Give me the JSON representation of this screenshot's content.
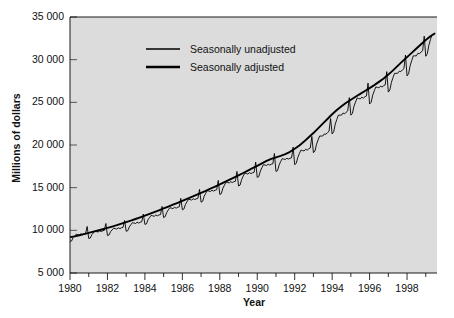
{
  "chart_data": {
    "type": "line",
    "title": "",
    "xlabel": "Year",
    "ylabel": "Millions of dollars",
    "xlim": [
      1980.0,
      1999.6
    ],
    "ylim": [
      5000,
      35000
    ],
    "grid": false,
    "legend_position": "top-left-inside",
    "y_ticks": [
      5000,
      10000,
      15000,
      20000,
      25000,
      30000,
      35000
    ],
    "y_tick_labels": [
      "5 000",
      "10 000",
      "15 000",
      "20 000",
      "25 000",
      "30 000",
      "35 000"
    ],
    "x_ticks_major": [
      1980,
      1982,
      1984,
      1986,
      1988,
      1990,
      1992,
      1994,
      1996,
      1998
    ],
    "x_tick_labels": [
      "1980",
      "1982",
      "1984",
      "1986",
      "1988",
      "1990",
      "1992",
      "1994",
      "1996",
      "1998"
    ],
    "x_ticks_minor": [
      1981,
      1983,
      1985,
      1987,
      1989,
      1991,
      1993,
      1995,
      1997,
      1999
    ],
    "plot_bg_color": "#dcdcdc",
    "line_color": "#000000",
    "series": [
      {
        "name": "Seasonally unadjusted",
        "line_width": 0.9,
        "x": [
          1980.0,
          1980.083,
          1980.167,
          1980.25,
          1980.333,
          1980.417,
          1980.5,
          1980.583,
          1980.667,
          1980.75,
          1980.833,
          1980.917,
          1981.0,
          1981.083,
          1981.167,
          1981.25,
          1981.333,
          1981.417,
          1981.5,
          1981.583,
          1981.667,
          1981.75,
          1981.833,
          1981.917,
          1982.0,
          1982.083,
          1982.167,
          1982.25,
          1982.333,
          1982.417,
          1982.5,
          1982.583,
          1982.667,
          1982.75,
          1982.833,
          1982.917,
          1983.0,
          1983.083,
          1983.167,
          1983.25,
          1983.333,
          1983.417,
          1983.5,
          1983.583,
          1983.667,
          1983.75,
          1983.833,
          1983.917,
          1984.0,
          1984.083,
          1984.167,
          1984.25,
          1984.333,
          1984.417,
          1984.5,
          1984.583,
          1984.667,
          1984.75,
          1984.833,
          1984.917,
          1985.0,
          1985.083,
          1985.167,
          1985.25,
          1985.333,
          1985.417,
          1985.5,
          1985.583,
          1985.667,
          1985.75,
          1985.833,
          1985.917,
          1986.0,
          1986.083,
          1986.167,
          1986.25,
          1986.333,
          1986.417,
          1986.5,
          1986.583,
          1986.667,
          1986.75,
          1986.833,
          1986.917,
          1987.0,
          1987.083,
          1987.167,
          1987.25,
          1987.333,
          1987.417,
          1987.5,
          1987.583,
          1987.667,
          1987.75,
          1987.833,
          1987.917,
          1988.0,
          1988.083,
          1988.167,
          1988.25,
          1988.333,
          1988.417,
          1988.5,
          1988.583,
          1988.667,
          1988.75,
          1988.833,
          1988.917,
          1989.0,
          1989.083,
          1989.167,
          1989.25,
          1989.333,
          1989.417,
          1989.5,
          1989.583,
          1989.667,
          1989.75,
          1989.833,
          1989.917,
          1990.0,
          1990.083,
          1990.167,
          1990.25,
          1990.333,
          1990.417,
          1990.5,
          1990.583,
          1990.667,
          1990.75,
          1990.833,
          1990.917,
          1991.0,
          1991.083,
          1991.167,
          1991.25,
          1991.333,
          1991.417,
          1991.5,
          1991.583,
          1991.667,
          1991.75,
          1991.833,
          1991.917,
          1992.0,
          1992.083,
          1992.167,
          1992.25,
          1992.333,
          1992.417,
          1992.5,
          1992.583,
          1992.667,
          1992.75,
          1992.833,
          1992.917,
          1993.0,
          1993.083,
          1993.167,
          1993.25,
          1993.333,
          1993.417,
          1993.5,
          1993.583,
          1993.667,
          1993.75,
          1993.833,
          1993.917,
          1994.0,
          1994.083,
          1994.167,
          1994.25,
          1994.333,
          1994.417,
          1994.5,
          1994.583,
          1994.667,
          1994.75,
          1994.833,
          1994.917,
          1995.0,
          1995.083,
          1995.167,
          1995.25,
          1995.333,
          1995.417,
          1995.5,
          1995.583,
          1995.667,
          1995.75,
          1995.833,
          1995.917,
          1996.0,
          1996.083,
          1996.167,
          1996.25,
          1996.333,
          1996.417,
          1996.5,
          1996.583,
          1996.667,
          1996.75,
          1996.833,
          1996.917,
          1997.0,
          1997.083,
          1997.167,
          1997.25,
          1997.333,
          1997.417,
          1997.5,
          1997.583,
          1997.667,
          1997.75,
          1997.833,
          1997.917,
          1998.0,
          1998.083,
          1998.167,
          1998.25,
          1998.333,
          1998.417,
          1998.5,
          1998.583,
          1998.667,
          1998.75,
          1998.833,
          1998.917,
          1999.0,
          1999.083,
          1999.167,
          1999.25,
          1999.333,
          1999.417,
          1999.5
        ],
        "y": [
          8700,
          8750,
          9150,
          9350,
          9550,
          9500,
          9450,
          9600,
          9500,
          9600,
          9650,
          10450,
          9050,
          9100,
          9500,
          9700,
          9900,
          9850,
          9800,
          9950,
          9850,
          9950,
          10000,
          10800,
          9400,
          9450,
          9850,
          10050,
          10250,
          10200,
          10150,
          10300,
          10200,
          10300,
          10350,
          11150,
          9900,
          9950,
          10400,
          10650,
          10900,
          10850,
          10800,
          10950,
          10850,
          10950,
          11000,
          11900,
          10700,
          10750,
          11250,
          11500,
          11750,
          11700,
          11650,
          11800,
          11700,
          11800,
          11850,
          12800,
          11500,
          11600,
          12100,
          12400,
          12650,
          12600,
          12550,
          12700,
          12600,
          12700,
          12750,
          13750,
          12400,
          12500,
          13050,
          13350,
          13650,
          13600,
          13550,
          13700,
          13600,
          13700,
          13750,
          14800,
          13300,
          13400,
          14000,
          14350,
          14650,
          14600,
          14550,
          14700,
          14600,
          14700,
          14750,
          15850,
          14200,
          14300,
          14950,
          15300,
          15650,
          15600,
          15550,
          15700,
          15600,
          15700,
          15750,
          16900,
          15200,
          15300,
          15950,
          16350,
          16700,
          16650,
          16600,
          16750,
          16650,
          16750,
          16800,
          18000,
          16200,
          16300,
          16950,
          17350,
          17700,
          17650,
          17600,
          17750,
          17650,
          17750,
          17800,
          19000,
          16900,
          17000,
          17650,
          18050,
          18400,
          18350,
          18300,
          18450,
          18350,
          18450,
          18500,
          19750,
          17700,
          17850,
          18550,
          19000,
          19400,
          19350,
          19300,
          19500,
          19400,
          19550,
          19650,
          21000,
          19100,
          19300,
          20100,
          20600,
          21050,
          21050,
          21050,
          21300,
          21250,
          21450,
          21600,
          23100,
          21300,
          21550,
          22450,
          23000,
          23500,
          23500,
          23500,
          23750,
          23650,
          23850,
          24000,
          25550,
          23500,
          23700,
          24550,
          25050,
          25500,
          25450,
          25400,
          25600,
          25500,
          25650,
          25750,
          27250,
          24800,
          25000,
          25850,
          26350,
          26800,
          26750,
          26700,
          26900,
          26800,
          26950,
          27050,
          28600,
          26200,
          26450,
          27350,
          27900,
          28400,
          28400,
          28400,
          28650,
          28600,
          28800,
          28950,
          30550,
          28100,
          28350,
          29300,
          29900,
          30450,
          30450,
          30450,
          30750,
          30700,
          30900,
          31050,
          32750,
          30400,
          30700,
          31700,
          32350,
          32950,
          33000,
          33100
        ]
      },
      {
        "name": "Seasonally adjusted",
        "line_width": 1.9,
        "x": [
          1980.0,
          1980.25,
          1980.5,
          1980.75,
          1981.0,
          1981.25,
          1981.5,
          1981.75,
          1982.0,
          1982.25,
          1982.5,
          1982.75,
          1983.0,
          1983.25,
          1983.5,
          1983.75,
          1984.0,
          1984.25,
          1984.5,
          1984.75,
          1985.0,
          1985.25,
          1985.5,
          1985.75,
          1986.0,
          1986.25,
          1986.5,
          1986.75,
          1987.0,
          1987.25,
          1987.5,
          1987.75,
          1988.0,
          1988.25,
          1988.5,
          1988.75,
          1989.0,
          1989.25,
          1989.5,
          1989.75,
          1990.0,
          1990.25,
          1990.5,
          1990.75,
          1991.0,
          1991.25,
          1991.5,
          1991.75,
          1992.0,
          1992.25,
          1992.5,
          1992.75,
          1993.0,
          1993.25,
          1993.5,
          1993.75,
          1994.0,
          1994.25,
          1994.5,
          1994.75,
          1995.0,
          1995.25,
          1995.5,
          1995.75,
          1996.0,
          1996.25,
          1996.5,
          1996.75,
          1997.0,
          1997.25,
          1997.5,
          1997.75,
          1998.0,
          1998.25,
          1998.5,
          1998.75,
          1999.0,
          1999.25,
          1999.5
        ],
        "y": [
          9200,
          9300,
          9420,
          9560,
          9700,
          9840,
          9980,
          10130,
          10280,
          10440,
          10600,
          10780,
          10960,
          11140,
          11330,
          11520,
          11720,
          11920,
          12130,
          12340,
          12560,
          12780,
          13000,
          13220,
          13450,
          13680,
          13910,
          14150,
          14390,
          14630,
          14880,
          15130,
          15390,
          15650,
          15910,
          16180,
          16450,
          16720,
          17000,
          17280,
          17560,
          17850,
          18140,
          18380,
          18560,
          18720,
          18920,
          19200,
          19560,
          19950,
          20400,
          20900,
          21400,
          21950,
          22500,
          23050,
          23600,
          24100,
          24550,
          24950,
          25300,
          25650,
          25990,
          26330,
          26670,
          27020,
          27400,
          27800,
          28250,
          28750,
          29280,
          29800,
          30300,
          30800,
          31300,
          31800,
          32300,
          32750,
          33100
        ]
      }
    ]
  },
  "legend": {
    "items": [
      {
        "label": "Seasonally unadjusted"
      },
      {
        "label": "Seasonally adjusted"
      }
    ]
  },
  "axes": {
    "y_title": "Millions of dollars",
    "x_title": "Year"
  }
}
